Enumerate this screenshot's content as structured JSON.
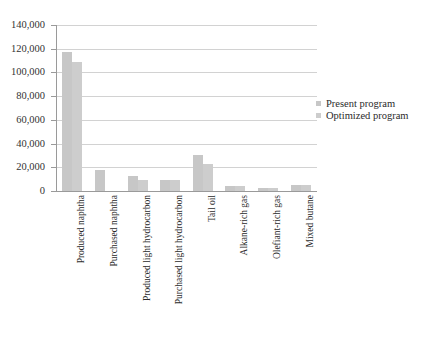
{
  "chart_data": {
    "type": "bar",
    "title": "",
    "subtitle": "",
    "xlabel": "",
    "ylabel": "",
    "ylim": [
      0,
      140000
    ],
    "ytick_values": [
      0,
      20000,
      40000,
      60000,
      80000,
      100000,
      120000,
      140000
    ],
    "ytick_labels": [
      "0",
      "20,000",
      "40,000",
      "60,000",
      "80,000",
      "100,000",
      "120,000",
      "140,000"
    ],
    "grid": true,
    "legend_position": "right",
    "categories": [
      "Produced naphtha",
      "Purchased naphtha",
      "Produced light hydrocarbon",
      "Purchased light hydrocarbon",
      "Tail oil",
      "Alkane-rich gas",
      "Olefiant-rich gas",
      "Mixed butane"
    ],
    "series": [
      {
        "name": "Present program",
        "color": "#c7c7c7",
        "values": [
          117000,
          17500,
          12500,
          9000,
          30000,
          4500,
          2500,
          5000
        ]
      },
      {
        "name": "Optimized program",
        "color": "#cdcdcd",
        "values": [
          109000,
          0,
          9500,
          9000,
          23000,
          4500,
          2500,
          5000
        ]
      }
    ]
  },
  "legend": {
    "items": [
      {
        "label": "Present program"
      },
      {
        "label": "Optimized program"
      }
    ]
  }
}
